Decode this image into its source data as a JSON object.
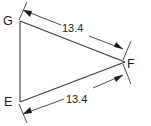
{
  "figure": {
    "type": "triangle-with-dimensions",
    "background_color": "#ffffff",
    "stroke_color": "#3a3a3a",
    "text_color": "#1a1a1a",
    "vertices": [
      {
        "name": "G",
        "label": "G",
        "x": 20,
        "y": 21
      },
      {
        "name": "F",
        "label": "F",
        "x": 125,
        "y": 62
      },
      {
        "name": "E",
        "label": "E",
        "x": 20,
        "y": 102
      }
    ],
    "dimensions": [
      {
        "name": "gf",
        "label": "13.4",
        "measures": "G to F",
        "from_x": 23,
        "from_y": 10,
        "to_x": 123,
        "to_y": 49
      },
      {
        "name": "ef",
        "label": "13.4",
        "measures": "E to F",
        "from_x": 23,
        "from_y": 114,
        "to_x": 123,
        "to_y": 75
      }
    ],
    "sides": [
      {
        "name": "side-gf",
        "from": "G",
        "to": "F"
      },
      {
        "name": "side-fe",
        "from": "F",
        "to": "E"
      },
      {
        "name": "side-eg",
        "from": "E",
        "to": "G"
      }
    ]
  }
}
